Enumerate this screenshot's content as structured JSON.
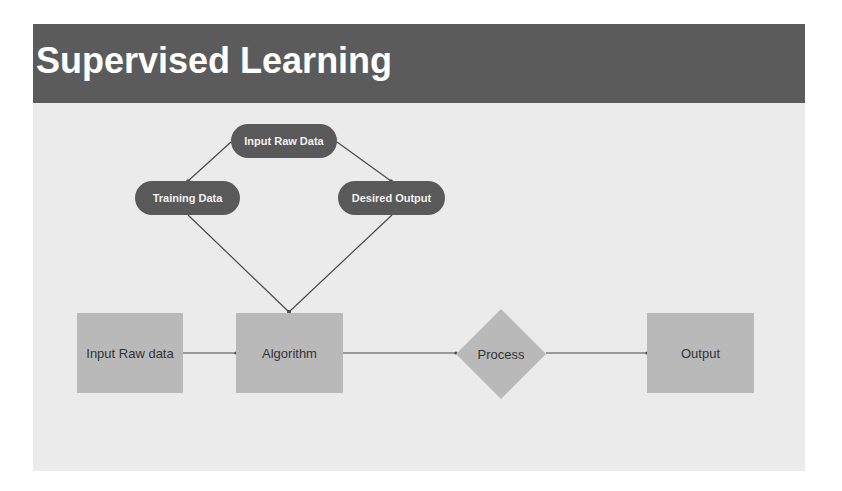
{
  "slide": {
    "title": "Supervised Learning"
  },
  "diagram": {
    "pills": {
      "input_raw_data": "Input Raw Data",
      "training_data": "Training Data",
      "desired_output": "Desired Output"
    },
    "flow": {
      "input": "Input Raw data",
      "algorithm": "Algorithm",
      "process": "Process",
      "output": "Output"
    }
  },
  "colors": {
    "title_bar": "#5b5b5b",
    "slide_bg": "#ebebeb",
    "pill_bg": "#595959",
    "box_bg": "#b9b9b9",
    "line": "#4a4a4a"
  }
}
